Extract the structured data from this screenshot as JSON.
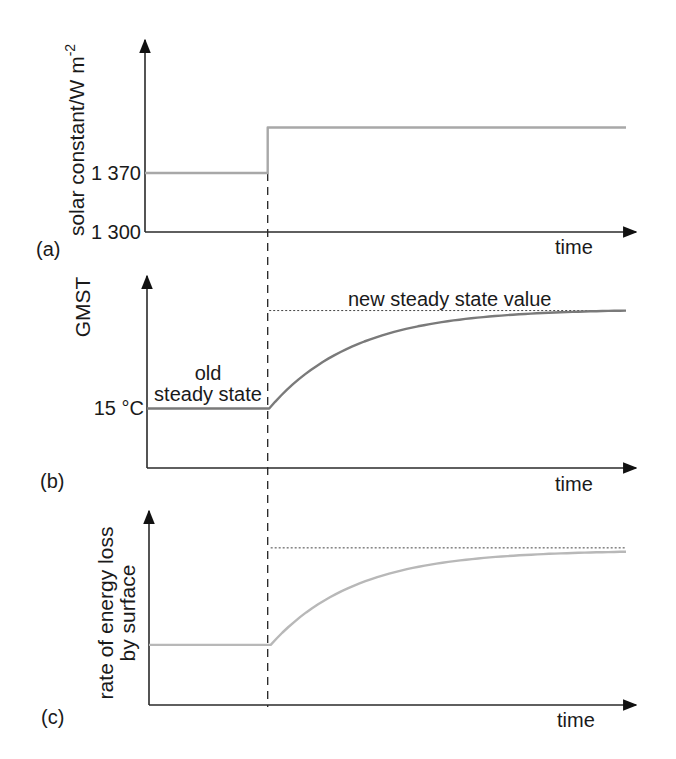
{
  "chart_data": [
    {
      "type": "line",
      "panel_label": "(a)",
      "ylabel": "solar constant/W m",
      "ylabel_superscript": "-2",
      "xlabel": "time",
      "yticks": [
        {
          "value": 1300,
          "label": "1 300"
        },
        {
          "value": 1370,
          "label": "1 370"
        }
      ],
      "ylim": [
        1300,
        1450
      ],
      "xlim": [
        0,
        1
      ],
      "step_time": 0.25,
      "series": [
        {
          "name": "solar constant",
          "color": "#a8a8a8",
          "points": [
            [
              0,
              1370
            ],
            [
              0.25,
              1370
            ],
            [
              0.25,
              1424
            ],
            [
              0.98,
              1424
            ]
          ]
        }
      ]
    },
    {
      "type": "line",
      "panel_label": "(b)",
      "ylabel": "GMST",
      "xlabel": "time",
      "yticks": [
        {
          "value": 15,
          "label": "15 °C"
        }
      ],
      "ylim": [
        0,
        1
      ],
      "xlim": [
        0,
        1
      ],
      "step_time": 0.25,
      "annotations": [
        {
          "text_lines": [
            "old",
            "steady state"
          ],
          "refers_to": "old level"
        },
        {
          "text": "new steady state value",
          "refers_to": "asymptote"
        }
      ],
      "series": [
        {
          "name": "GMST",
          "color": "#7a7a7a",
          "old_level": 0.31,
          "new_level": 0.82,
          "response": "exponential approach"
        }
      ],
      "asymptote": 0.82
    },
    {
      "type": "line",
      "panel_label": "(c)",
      "ylabel_lines": [
        "rate of energy loss",
        "by surface"
      ],
      "xlabel": "time",
      "ylim": [
        0,
        1
      ],
      "xlim": [
        0,
        1
      ],
      "step_time": 0.25,
      "series": [
        {
          "name": "rate of energy loss",
          "color": "#b8b8b8",
          "old_level": 0.31,
          "new_level": 0.79,
          "response": "exponential approach"
        }
      ],
      "asymptote": 0.81
    }
  ]
}
